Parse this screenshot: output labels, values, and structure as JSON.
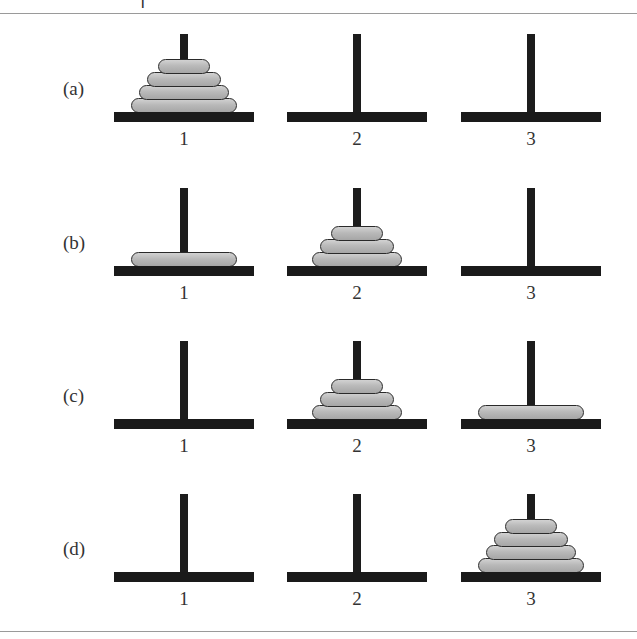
{
  "top_fragment": "1",
  "rows": [
    {
      "label": "(a)",
      "pegs": [
        {
          "number": "1",
          "disks": [
            4,
            3,
            2,
            1
          ]
        },
        {
          "number": "2",
          "disks": []
        },
        {
          "number": "3",
          "disks": []
        }
      ]
    },
    {
      "label": "(b)",
      "pegs": [
        {
          "number": "1",
          "disks": [
            4
          ]
        },
        {
          "number": "2",
          "disks": [
            3,
            2,
            1
          ]
        },
        {
          "number": "3",
          "disks": []
        }
      ]
    },
    {
      "label": "(c)",
      "pegs": [
        {
          "number": "1",
          "disks": []
        },
        {
          "number": "2",
          "disks": [
            3,
            2,
            1
          ]
        },
        {
          "number": "3",
          "disks": [
            4
          ]
        }
      ]
    },
    {
      "label": "(d)",
      "pegs": [
        {
          "number": "1",
          "disks": []
        },
        {
          "number": "2",
          "disks": []
        },
        {
          "number": "3",
          "disks": [
            4,
            3,
            2,
            1
          ]
        }
      ]
    }
  ],
  "colors": {
    "pole": "#1c1c1c",
    "base": "#1a1a1a",
    "disk": "#b9b9b9",
    "rule": "#9a9a9a"
  }
}
